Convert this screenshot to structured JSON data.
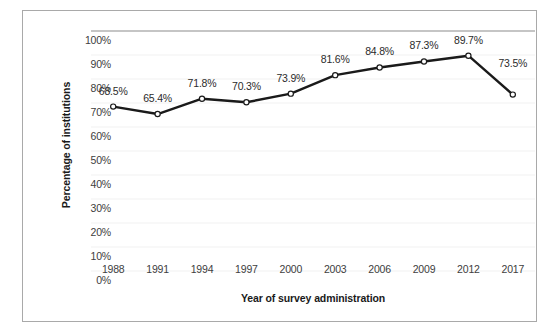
{
  "chart_data": {
    "type": "line",
    "title": "",
    "xlabel": "Year of survey administration",
    "ylabel": "Percentage of institutions",
    "categories": [
      "1988",
      "1991",
      "1994",
      "1997",
      "2000",
      "2003",
      "2006",
      "2009",
      "2012",
      "2017"
    ],
    "values": [
      68.5,
      65.4,
      71.8,
      70.3,
      73.9,
      81.6,
      84.8,
      87.3,
      89.7,
      73.5
    ],
    "point_labels": [
      "68.5%",
      "65.4%",
      "71.8%",
      "70.3%",
      "73.9%",
      "81.6%",
      "84.8%",
      "87.3%",
      "89.7%",
      "73.5%"
    ],
    "ylim": [
      0,
      100
    ],
    "ytick_values": [
      100,
      90,
      80,
      70,
      60,
      50,
      40,
      30,
      20,
      10,
      0
    ],
    "ytick_labels": [
      "100%",
      "90%",
      "80%",
      "70%",
      "60%",
      "50%",
      "40%",
      "30%",
      "20%",
      "10%",
      "0%"
    ],
    "grid": true,
    "legend": "none",
    "series_name": "Percentage of institutions",
    "colors": {
      "line": "#1a1a1a",
      "marker_fill": "#ffffff",
      "marker_stroke": "#1a1a1a",
      "grid": "#f1f1f1",
      "axis_text": "#404040",
      "title_text": "#1a1a1a",
      "frame": "#a9a9a9",
      "background": "#ffffff"
    }
  }
}
